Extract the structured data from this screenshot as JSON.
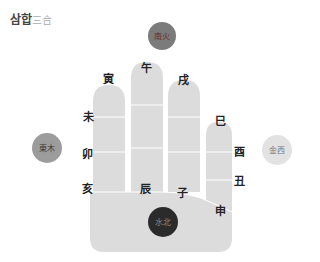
{
  "title": {
    "korean": "삼합",
    "hanja": "三合"
  },
  "circles": {
    "south": {
      "label": "南火",
      "line1": "南",
      "line2": "火",
      "color": "#7b7b7b",
      "text_color": "#6a2a2a"
    },
    "east": {
      "label": "東木",
      "color": "#9c9c9c",
      "text_color": "#3a3a3a"
    },
    "west": {
      "label": "金西",
      "color": "#e2e2e2",
      "text_color": "#777777"
    },
    "north": {
      "label": "水北",
      "line1": "水",
      "line2": "北",
      "color": "#2b2b2b",
      "text_color": "#8a8a8a"
    }
  },
  "branches": {
    "yin": "寅",
    "wu": "午",
    "xu": "戌",
    "si": "巳",
    "wei": "未",
    "mao": "卯",
    "hai": "亥",
    "chen": "辰",
    "zi": "子",
    "you": "酉",
    "chou": "丑",
    "shen": "申"
  },
  "hand_color": "#dcdcdc"
}
